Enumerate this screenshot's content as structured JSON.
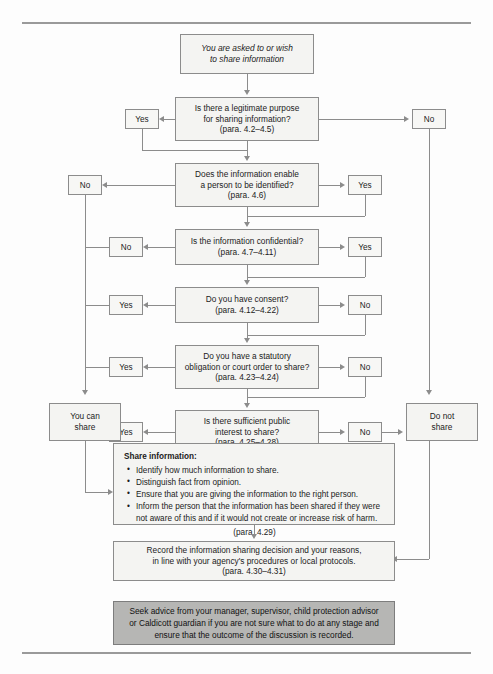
{
  "flow": {
    "start": {
      "lines": [
        "You are asked to or wish",
        "to share information"
      ]
    },
    "decisions": [
      {
        "id": "legitimate-purpose",
        "lines": [
          "Is there a legitimate purpose",
          "for sharing information?"
        ],
        "para": "(para. 4.2–4.5)",
        "left_label": "Yes",
        "right_label": "No"
      },
      {
        "id": "person-identified",
        "lines": [
          "Does the information enable",
          "a person to be identified?"
        ],
        "para": "(para. 4.6)",
        "left_label": "No",
        "right_label": "Yes"
      },
      {
        "id": "information-confidential",
        "lines": [
          "Is the information confidential?"
        ],
        "para": "(para. 4.7–4.11)",
        "left_label": "No",
        "right_label": "Yes"
      },
      {
        "id": "have-consent",
        "lines": [
          "Do you have consent?"
        ],
        "para": "(para. 4.12–4.22)",
        "left_label": "Yes",
        "right_label": "No"
      },
      {
        "id": "statutory-obligation",
        "lines": [
          "Do you have a statutory",
          "obligation or court order to share?"
        ],
        "para": "(para. 4.23–4.24)",
        "left_label": "Yes",
        "right_label": "No"
      },
      {
        "id": "public-interest",
        "lines": [
          "Is there sufficient public",
          "interest to share?"
        ],
        "para": "(para. 4.25–4.28)",
        "left_label": "Yes",
        "right_label": "No"
      }
    ],
    "outcomes": {
      "can_share": {
        "lines": [
          "You can",
          "share"
        ]
      },
      "do_not_share": {
        "lines": [
          "Do not",
          "share"
        ]
      }
    },
    "share_information": {
      "heading": "Share information:",
      "bullets": [
        "Identify how much information to share.",
        "Distinguish fact from opinion.",
        "Ensure that you are giving the information to the right person.",
        "Inform the person that the information has been shared if they were not aware of this and if it would not create or increase risk of harm."
      ],
      "para": "(para. 4.29)"
    },
    "record": {
      "lines": [
        "Record the information sharing decision and your reasons,",
        "in line with your agency's procedures or local protocols."
      ],
      "para": "(para. 4.30–4.31)"
    },
    "advisory": {
      "lines": [
        "Seek advice from your manager, supervisor, child protection",
        "advisor or Caldicott guardian if you are not sure what to do at any",
        "stage and ensure that the outcome of the discussion is recorded."
      ]
    }
  }
}
